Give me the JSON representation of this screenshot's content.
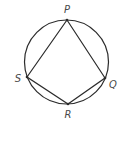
{
  "diagram": {
    "type": "inscribed-quadrilateral",
    "stroke_color": "#2b2b2b",
    "label_color": "#4a4a4a",
    "circle": {
      "cx": 66.5,
      "cy": 62,
      "r": 42
    },
    "vertices": [
      {
        "name": "P",
        "x": 67,
        "y": 20,
        "label_x": 67,
        "label_y": 13
      },
      {
        "name": "Q",
        "x": 105,
        "y": 78,
        "label_x": 113,
        "label_y": 88
      },
      {
        "name": "R",
        "x": 68,
        "y": 104,
        "label_x": 68,
        "label_y": 118
      },
      {
        "name": "S",
        "x": 27,
        "y": 77,
        "label_x": 18,
        "label_y": 82
      }
    ],
    "polygon_order": [
      "P",
      "Q",
      "R",
      "S"
    ],
    "labels": {
      "P": "P",
      "Q": "Q",
      "R": "R",
      "S": "S"
    }
  }
}
